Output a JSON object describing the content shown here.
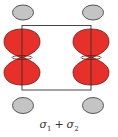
{
  "diagram": {
    "label": {
      "sym1": "σ",
      "sub1": "1",
      "operator": "+",
      "sym2": "σ",
      "sub2": "2"
    },
    "colors": {
      "lobe_fill": "#e8302a",
      "lobe_stroke": "#6a1a14",
      "atom_fill": "#c4c4c4",
      "atom_stroke": "#555555",
      "frame_stroke": "#333333"
    },
    "atoms": [
      {
        "id": "top-left",
        "cx": 23,
        "cy": 12
      },
      {
        "id": "top-right",
        "cx": 93,
        "cy": 12
      },
      {
        "id": "bottom-left",
        "cx": 23,
        "cy": 105
      },
      {
        "id": "bottom-right",
        "cx": 93,
        "cy": 105
      }
    ],
    "orbitals": [
      {
        "id": "left-p-orbital",
        "cx": 22
      },
      {
        "id": "right-p-orbital",
        "cx": 91
      }
    ]
  }
}
